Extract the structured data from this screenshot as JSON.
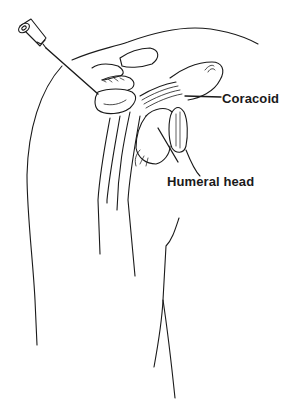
{
  "figure": {
    "type": "anatomical-line-drawing",
    "line_color": "#1a1a1a",
    "background": "#ffffff"
  },
  "labels": {
    "coracoid": "Coracoid",
    "humeral_head": "Humeral head"
  },
  "icons": {
    "needle": "syringe-needle-icon"
  }
}
